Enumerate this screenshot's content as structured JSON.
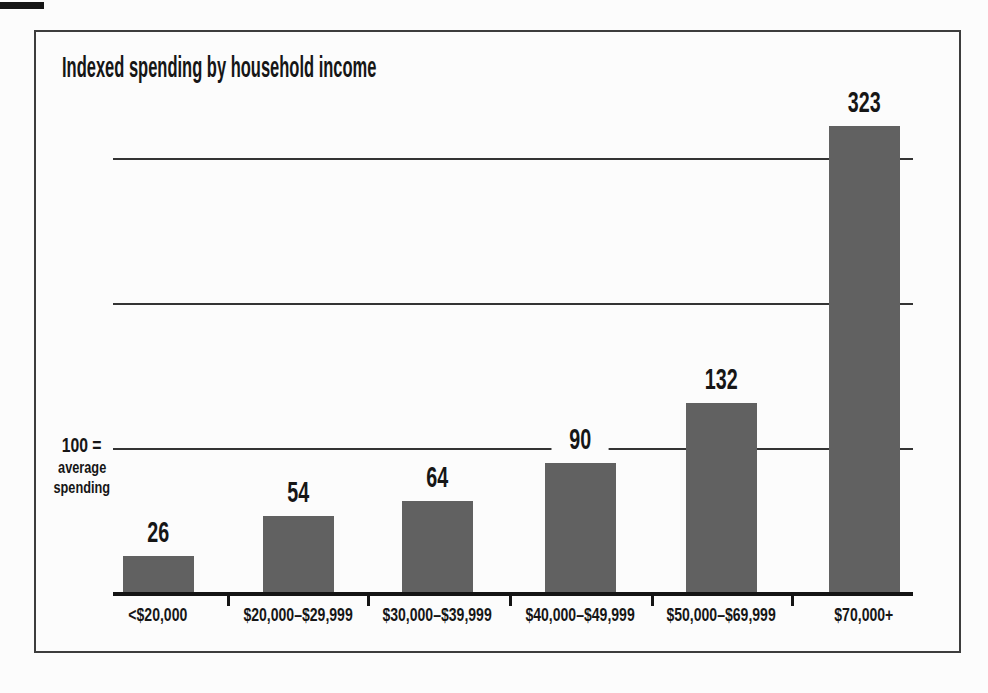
{
  "page": {
    "background": "#fcfcfc",
    "frame_border_color": "#3d3d3d",
    "scan_artifact": "black-dash-top-left"
  },
  "chart": {
    "title": "Indexed spending by household income",
    "annotation": {
      "line1": "100 =",
      "line2": "average",
      "line3": "spending"
    }
  },
  "chart_data": {
    "type": "bar",
    "title": "Indexed spending by household income",
    "categories": [
      "<$20,000",
      "$20,000–$29,999",
      "$30,000–$39,999",
      "$40,000–$49,999",
      "$50,000–$69,999",
      "$70,000+"
    ],
    "values": [
      26,
      54,
      64,
      90,
      132,
      323
    ],
    "value_labels": [
      "26",
      "54",
      "64",
      "90",
      "132",
      "323"
    ],
    "xlabel": "",
    "ylabel": "",
    "annotation": "100 = average spending",
    "baseline_value": 0,
    "ylim": [
      0,
      400
    ],
    "gridline_values": [
      100,
      200,
      300
    ],
    "grid": "horizontal-only",
    "legend": "none",
    "bar_color": "#616161",
    "axis_color": "#141414",
    "text_color": "#161616"
  }
}
